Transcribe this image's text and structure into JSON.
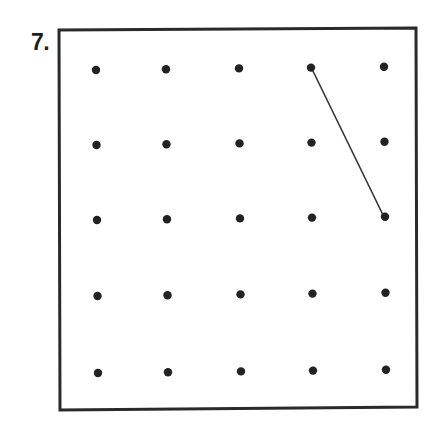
{
  "problem": {
    "number_label": "7."
  },
  "geoboard": {
    "frame": {
      "x1": 59,
      "y1": 30,
      "x2": 417,
      "y2": 410,
      "stroke": "#2a2a2a",
      "stroke_width": 3
    },
    "grid": {
      "rows": 5,
      "cols": 5,
      "col_x": [
        96,
        166,
        239,
        311,
        384
      ],
      "row_y": [
        70,
        145,
        220,
        296,
        373
      ],
      "dot_radius": 4.2,
      "dot_color": "#222222"
    },
    "segments": [
      {
        "from": {
          "row": 0,
          "col": 3
        },
        "to": {
          "row": 2,
          "col": 4
        },
        "color": "#333333",
        "width": 1.6
      }
    ]
  }
}
